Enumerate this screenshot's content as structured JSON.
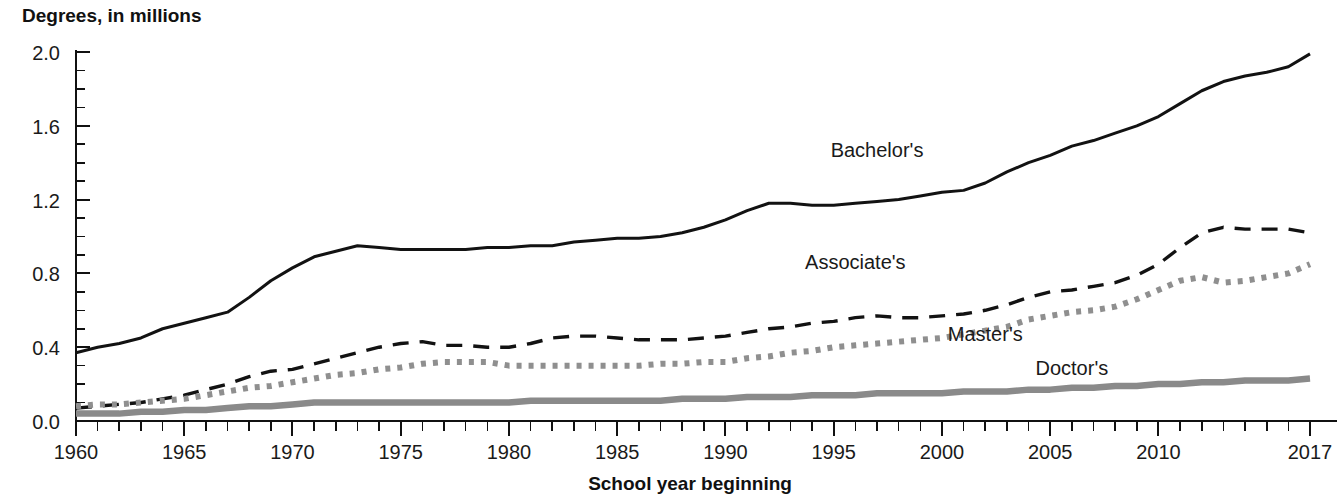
{
  "chart_data": {
    "type": "line",
    "title": "Degrees, in millions",
    "xlabel": "School year beginning",
    "ylabel": "Degrees, in millions",
    "xlim": [
      1960,
      2017
    ],
    "ylim": [
      0.0,
      2.0
    ],
    "grid": false,
    "legend_position": "inline-annotations",
    "y_ticks": [
      "0.0",
      "0.4",
      "0.8",
      "1.2",
      "1.6",
      "2.0"
    ],
    "y_tick_values": [
      0.0,
      0.4,
      0.8,
      1.2,
      1.6,
      2.0
    ],
    "y_minor_step": 0.1,
    "x_ticks": [
      "1960",
      "1965",
      "1970",
      "1975",
      "1980",
      "1985",
      "1990",
      "1995",
      "2000",
      "2005",
      "2010",
      "2017"
    ],
    "x_tick_values": [
      1960,
      1965,
      1970,
      1975,
      1980,
      1985,
      1990,
      1995,
      2000,
      2005,
      2010,
      2017
    ],
    "x_minor_step": 1,
    "x": [
      1960,
      1961,
      1962,
      1963,
      1964,
      1965,
      1966,
      1967,
      1968,
      1969,
      1970,
      1971,
      1972,
      1973,
      1974,
      1975,
      1976,
      1977,
      1978,
      1979,
      1980,
      1981,
      1982,
      1983,
      1984,
      1985,
      1986,
      1987,
      1988,
      1989,
      1990,
      1991,
      1992,
      1993,
      1994,
      1995,
      1996,
      1997,
      1998,
      1999,
      2000,
      2001,
      2002,
      2003,
      2004,
      2005,
      2006,
      2007,
      2008,
      2009,
      2010,
      2011,
      2012,
      2013,
      2014,
      2015,
      2016,
      2017
    ],
    "series": [
      {
        "name": "Bachelor's",
        "style": "solid",
        "color": "#121212",
        "width": 3.0,
        "label_x": 1997,
        "label_y": 1.47,
        "values": [
          0.37,
          0.4,
          0.42,
          0.45,
          0.5,
          0.53,
          0.56,
          0.59,
          0.67,
          0.76,
          0.83,
          0.89,
          0.92,
          0.95,
          0.94,
          0.93,
          0.93,
          0.93,
          0.93,
          0.94,
          0.94,
          0.95,
          0.95,
          0.97,
          0.98,
          0.99,
          0.99,
          1.0,
          1.02,
          1.05,
          1.09,
          1.14,
          1.18,
          1.18,
          1.17,
          1.17,
          1.18,
          1.19,
          1.2,
          1.22,
          1.24,
          1.25,
          1.29,
          1.35,
          1.4,
          1.44,
          1.49,
          1.52,
          1.56,
          1.6,
          1.65,
          1.72,
          1.79,
          1.84,
          1.87,
          1.89,
          1.92,
          1.99
        ]
      },
      {
        "name": "Associate's",
        "style": "dashed",
        "color": "#121212",
        "width": 3.4,
        "dasharray": "16 11",
        "label_x": 1996,
        "label_y": 0.86,
        "values": [
          0.07,
          0.08,
          0.09,
          0.1,
          0.12,
          0.14,
          0.17,
          0.2,
          0.24,
          0.27,
          0.28,
          0.31,
          0.34,
          0.37,
          0.4,
          0.42,
          0.43,
          0.41,
          0.41,
          0.4,
          0.4,
          0.42,
          0.45,
          0.46,
          0.46,
          0.45,
          0.44,
          0.44,
          0.44,
          0.45,
          0.46,
          0.48,
          0.5,
          0.51,
          0.53,
          0.54,
          0.56,
          0.57,
          0.56,
          0.56,
          0.57,
          0.58,
          0.6,
          0.63,
          0.67,
          0.7,
          0.71,
          0.73,
          0.75,
          0.79,
          0.85,
          0.94,
          1.02,
          1.05,
          1.04,
          1.04,
          1.04,
          1.02
        ]
      },
      {
        "name": "Master's",
        "style": "dotted",
        "color": "#8f8f8f",
        "width": 6.0,
        "dasharray": "5 7",
        "label_x": 2002,
        "label_y": 0.47,
        "values": [
          0.08,
          0.09,
          0.09,
          0.1,
          0.11,
          0.12,
          0.14,
          0.16,
          0.18,
          0.19,
          0.21,
          0.23,
          0.25,
          0.26,
          0.28,
          0.29,
          0.31,
          0.32,
          0.32,
          0.32,
          0.3,
          0.3,
          0.3,
          0.3,
          0.3,
          0.3,
          0.3,
          0.31,
          0.31,
          0.32,
          0.32,
          0.34,
          0.35,
          0.37,
          0.38,
          0.4,
          0.41,
          0.42,
          0.43,
          0.44,
          0.45,
          0.47,
          0.49,
          0.51,
          0.55,
          0.57,
          0.59,
          0.6,
          0.62,
          0.66,
          0.71,
          0.76,
          0.78,
          0.75,
          0.76,
          0.78,
          0.8,
          0.85
        ]
      },
      {
        "name": "Doctor's",
        "style": "solid-thick",
        "color": "#8a8a8a",
        "width": 6.5,
        "label_x": 2006,
        "label_y": 0.285,
        "values": [
          0.04,
          0.04,
          0.04,
          0.05,
          0.05,
          0.06,
          0.06,
          0.07,
          0.08,
          0.08,
          0.09,
          0.1,
          0.1,
          0.1,
          0.1,
          0.1,
          0.1,
          0.1,
          0.1,
          0.1,
          0.1,
          0.11,
          0.11,
          0.11,
          0.11,
          0.11,
          0.11,
          0.11,
          0.12,
          0.12,
          0.12,
          0.13,
          0.13,
          0.13,
          0.14,
          0.14,
          0.14,
          0.15,
          0.15,
          0.15,
          0.15,
          0.16,
          0.16,
          0.16,
          0.17,
          0.17,
          0.18,
          0.18,
          0.19,
          0.19,
          0.2,
          0.2,
          0.21,
          0.21,
          0.22,
          0.22,
          0.22,
          0.23
        ]
      }
    ]
  }
}
